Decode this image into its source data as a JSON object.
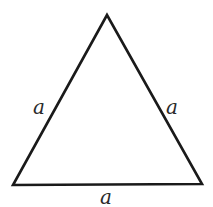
{
  "diagram": {
    "stroke_color": "#1a1a1a",
    "vertices": {
      "apex": [
        107,
        15
      ],
      "bottom_left": [
        13,
        185
      ],
      "bottom_right": [
        202,
        184
      ]
    },
    "labels": {
      "left_side": "a",
      "right_side": "a",
      "bottom_side": "a"
    }
  }
}
